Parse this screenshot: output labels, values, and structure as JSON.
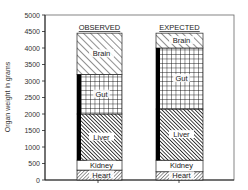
{
  "chart_data": {
    "type": "bar",
    "stacked": true,
    "title": "",
    "xlabel": "",
    "ylabel": "Organ weight in grams",
    "ylim": [
      0,
      5000
    ],
    "yticks": [
      0,
      500,
      1000,
      1500,
      2000,
      2500,
      3000,
      3500,
      4000,
      4500,
      5000
    ],
    "grid": false,
    "legend": "none (labels inside segments)",
    "categories": [
      "OBSERVED",
      "EXPECTED"
    ],
    "series": [
      {
        "name": "Heart",
        "values": [
          300,
          250
        ],
        "pattern": "dense-diagonal"
      },
      {
        "name": "Kidney",
        "values": [
          300,
          350
        ],
        "pattern": "white"
      },
      {
        "name": "Liver",
        "values": [
          1400,
          1550
        ],
        "pattern": "dark-diagonal"
      },
      {
        "name": "Gut",
        "values": [
          1200,
          1850
        ],
        "pattern": "grid"
      },
      {
        "name": "Brain",
        "values": [
          1250,
          450
        ],
        "pattern": "wide-diagonal"
      }
    ],
    "black_strip": {
      "description": "black vertical band on left side of Liver+Gut segments",
      "ranges": [
        [
          600,
          3200
        ],
        [
          600,
          4000
        ]
      ]
    },
    "totals": [
      4450,
      4450
    ]
  },
  "axis": {
    "ylabel": "Organ weight in grams",
    "ticks": [
      "0",
      "500",
      "1000",
      "1500",
      "2000",
      "2500",
      "3000",
      "3500",
      "4000",
      "4500",
      "5000"
    ]
  },
  "bars": [
    {
      "title": "OBSERVED",
      "labels": {
        "heart": "Heart",
        "kidney": "Kidney",
        "liver": "Liver",
        "gut": "Gut",
        "brain": "Brain"
      }
    },
    {
      "title": "EXPECTED",
      "labels": {
        "heart": "Heart",
        "kidney": "Kidney",
        "liver": "Liver",
        "gut": "Gut",
        "brain": "Brain"
      }
    }
  ]
}
